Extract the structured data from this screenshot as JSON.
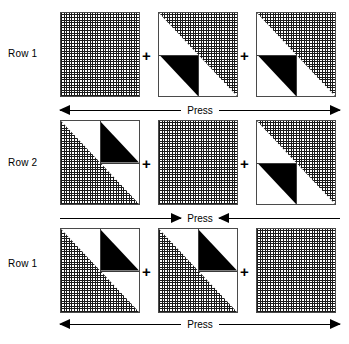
{
  "figure": {
    "width": 349,
    "height": 344,
    "background": "#ffffff",
    "ink": "#000000",
    "hatch_color": "#1a1a1a",
    "border_color": "#4a4a4a"
  },
  "rows": [
    {
      "label": "Row 1",
      "label_top": 48,
      "square_top": 12,
      "cells": [
        {
          "type": "grid",
          "x": 60
        },
        {
          "type": "tl-white",
          "x": 158
        },
        {
          "type": "tl-white",
          "x": 256
        }
      ],
      "plus_signs": [
        {
          "symbol": "+",
          "x": 142,
          "y": 48
        },
        {
          "symbol": "+",
          "x": 240,
          "y": 48
        }
      ]
    },
    {
      "label": "Row 2",
      "label_top": 157,
      "square_top": 120,
      "cells": [
        {
          "type": "br-white",
          "x": 60
        },
        {
          "type": "grid",
          "x": 158
        },
        {
          "type": "tl-white",
          "x": 256
        }
      ],
      "plus_signs": [
        {
          "symbol": "+",
          "x": 142,
          "y": 156
        },
        {
          "symbol": "+",
          "x": 240,
          "y": 156
        }
      ]
    },
    {
      "label": "Row 1",
      "label_top": 258,
      "square_top": 228,
      "cells": [
        {
          "type": "br-white",
          "x": 60
        },
        {
          "type": "br-white",
          "x": 158
        },
        {
          "type": "grid",
          "x": 256
        }
      ],
      "plus_signs": [
        {
          "symbol": "+",
          "x": 142,
          "y": 264
        },
        {
          "symbol": "+",
          "x": 240,
          "y": 264
        }
      ]
    }
  ],
  "press_bars": [
    {
      "label": "Press",
      "direction": "outward",
      "left": 60,
      "width": 280,
      "top": 100
    },
    {
      "label": "Press",
      "direction": "inward",
      "left": 60,
      "width": 280,
      "top": 208
    },
    {
      "label": "Press",
      "direction": "outward",
      "left": 60,
      "width": 280,
      "top": 314
    }
  ]
}
